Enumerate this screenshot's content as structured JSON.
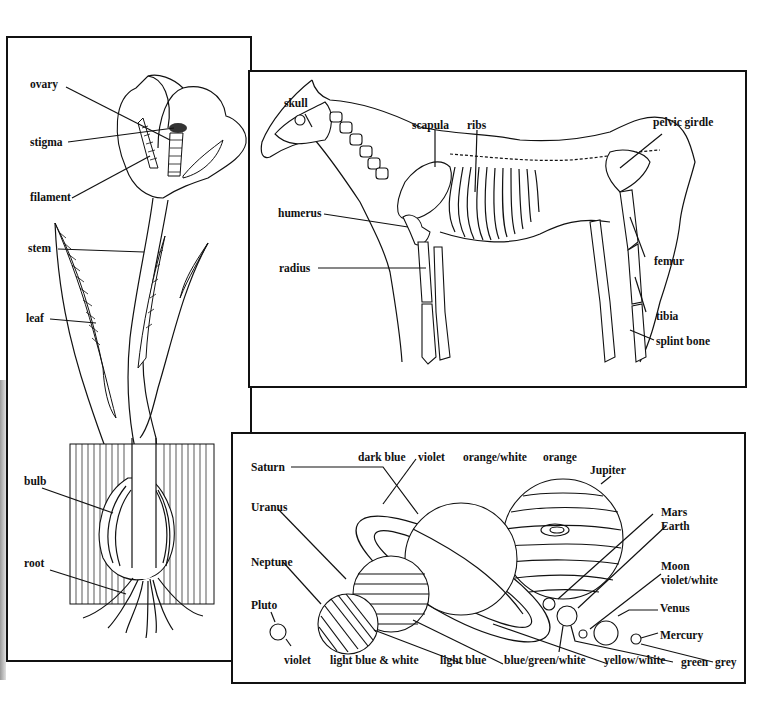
{
  "plant_panel": {
    "title": "flower plant diagram",
    "labels": {
      "ovary": "ovary",
      "stigma": "stigma",
      "filament": "filament",
      "stem": "stem",
      "leaf": "leaf",
      "bulb": "bulb",
      "root": "root"
    }
  },
  "horse_panel": {
    "title": "horse skeleton diagram",
    "labels": {
      "skull": "skull",
      "scapula": "scapula",
      "ribs": "ribs",
      "pelvic_girdle": "pelvic girdle",
      "humerus": "humerus",
      "radius": "radius",
      "femur": "femur",
      "tibia": "tibia",
      "splint_bone": "splint bone"
    }
  },
  "planets_panel": {
    "title": "solar system planets diagram",
    "planet_labels": {
      "saturn": "Saturn",
      "jupiter": "Jupiter",
      "uranus": "Uranus",
      "neptune": "Neptune",
      "pluto": "Pluto",
      "mars": "Mars",
      "earth": "Earth",
      "moon": "Moon",
      "venus": "Venus",
      "mercury": "Mercury"
    },
    "color_labels": {
      "dark_blue": "dark blue",
      "violet_top": "violet",
      "orange_white": "orange/white",
      "orange": "orange",
      "violet_white": "violet/white",
      "violet_bottom": "violet",
      "light_blue_white": "light blue & white",
      "light_blue": "light blue",
      "blue_green_white": "blue/green/white",
      "yellow_white": "yellow/white",
      "green": "green",
      "grey": "grey"
    }
  }
}
